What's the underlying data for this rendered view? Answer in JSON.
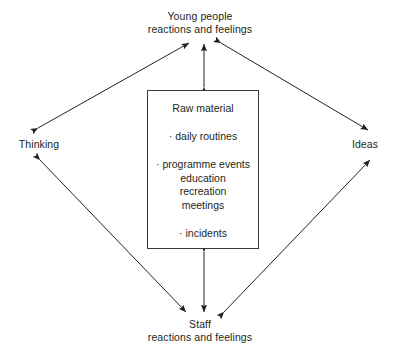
{
  "diagram": {
    "type": "cycle-diagram",
    "stroke_color": "#231f20",
    "background_color": "#ffffff",
    "nodes": {
      "top": {
        "line1": "Young people",
        "line2": "reactions and feelings"
      },
      "bottom": {
        "line1": "Staff",
        "line2": "reactions and feelings"
      },
      "left": {
        "label": "Thinking"
      },
      "right": {
        "label": "Ideas"
      }
    },
    "center_box": {
      "title": "Raw material",
      "items": [
        {
          "bullet": "·",
          "text": "daily routines",
          "sub": []
        },
        {
          "bullet": "·",
          "text": "programme events",
          "sub": [
            "education",
            "recreation",
            "meetings"
          ]
        },
        {
          "bullet": "·",
          "text": "incidents",
          "sub": []
        }
      ]
    },
    "connectors": [
      {
        "name": "thinking-to-young-people",
        "style": "double-headed",
        "orientation": "diagonal"
      },
      {
        "name": "young-people-to-ideas",
        "style": "double-headed",
        "orientation": "diagonal"
      },
      {
        "name": "thinking-to-staff",
        "style": "double-headed",
        "orientation": "diagonal"
      },
      {
        "name": "staff-to-ideas",
        "style": "double-headed",
        "orientation": "diagonal"
      },
      {
        "name": "box-to-young-people",
        "style": "double-headed",
        "orientation": "vertical"
      },
      {
        "name": "box-to-staff",
        "style": "double-headed",
        "orientation": "vertical"
      }
    ]
  }
}
